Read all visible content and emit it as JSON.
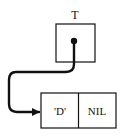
{
  "diagram": {
    "type": "linked-list-pointer",
    "pointer_variable": {
      "label": "T"
    },
    "node": {
      "fields": [
        {
          "name": "data",
          "value": "'D'"
        },
        {
          "name": "next",
          "value": "NIL"
        }
      ]
    },
    "colors": {
      "stroke": "#111111",
      "background": "#ffffff"
    }
  }
}
